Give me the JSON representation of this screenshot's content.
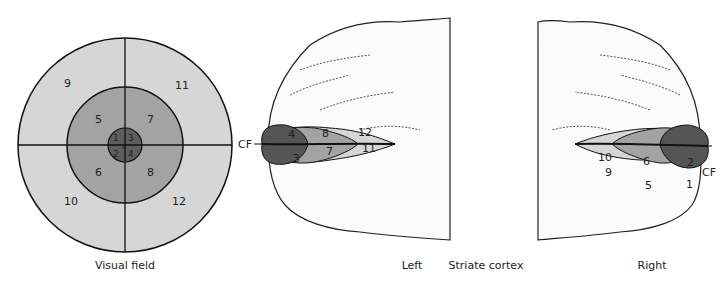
{
  "figure": {
    "visual_field": {
      "caption": "Visual field",
      "center_mark": "×",
      "regions": {
        "r1": "1",
        "r2": "2",
        "r3": "3",
        "r4": "4",
        "r5": "5",
        "r6": "6",
        "r7": "7",
        "r8": "8",
        "r9": "9",
        "r10": "10",
        "r11": "11",
        "r12": "12"
      }
    },
    "cortex": {
      "caption": "Striate cortex",
      "left": {
        "caption": "Left",
        "cf_label": "CF",
        "regions": {
          "r4": "4",
          "r3": "3",
          "r8": "8",
          "r7": "7",
          "r12": "12",
          "r11": "11"
        }
      },
      "right": {
        "caption": "Right",
        "cf_label": "CF",
        "regions": {
          "r2": "2",
          "r1": "1",
          "r6": "6",
          "r5": "5",
          "r10": "10",
          "r9": "9"
        }
      }
    },
    "colors": {
      "outer": "#d6d6d6",
      "middle": "#a3a3a3",
      "inner": "#5a5a5a",
      "line": "#111111"
    }
  }
}
